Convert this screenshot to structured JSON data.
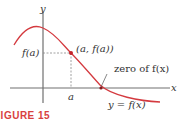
{
  "diagram": {
    "axes": {
      "x_label": "x",
      "y_label": "y"
    },
    "labels": {
      "f_of_a": "f(a)",
      "a": "a",
      "point": "(a, f(a))",
      "zero": "zero of f(x)",
      "curve": "y = f(x)"
    },
    "caption": "FIGURE 15",
    "colors": {
      "curve": "#d43a3f",
      "axes": "#707070",
      "point": "#c3232a",
      "guide": "#888888",
      "caption": "#d8413f"
    }
  }
}
